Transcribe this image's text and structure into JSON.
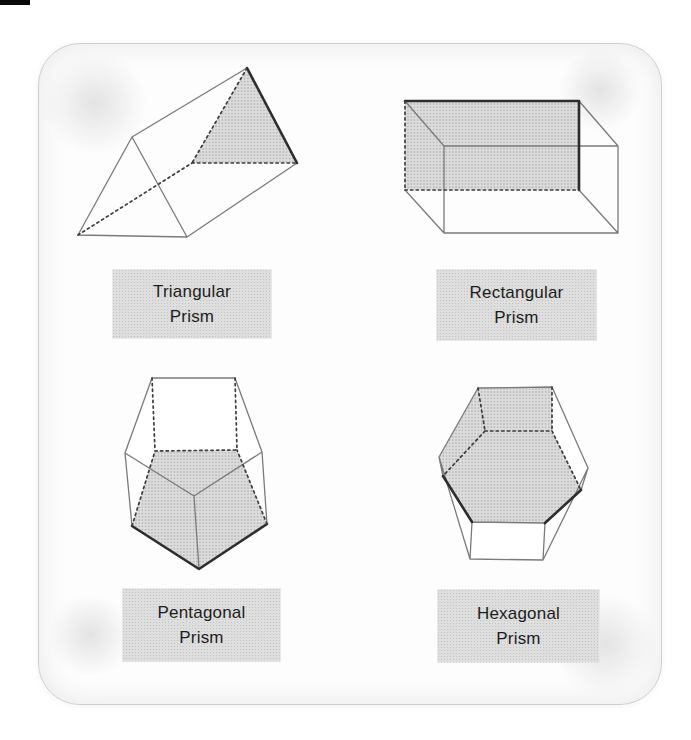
{
  "figure": {
    "prisms": [
      {
        "id": "triangular",
        "label_line1": "Triangular",
        "label_line2": "Prism"
      },
      {
        "id": "rectangular",
        "label_line1": "Rectangular",
        "label_line2": "Prism"
      },
      {
        "id": "pentagonal",
        "label_line1": "Pentagonal",
        "label_line2": "Prism"
      },
      {
        "id": "hexagonal",
        "label_line1": "Hexagonal",
        "label_line2": "Prism"
      }
    ],
    "colors": {
      "label_box_bg": "#dedede",
      "label_box_dot": "#c3c3c3",
      "shaded_face": "#d6d6d6",
      "edge_solid": "#7a7a7a",
      "edge_dark": "#2d2d2d",
      "edge_hidden_dashed": "#3c3c3c",
      "panel_background": "#fdfdfd",
      "panel_border": "#cfcfcf",
      "page_background": "#ffffff",
      "label_text": "#1d1d1d"
    }
  }
}
